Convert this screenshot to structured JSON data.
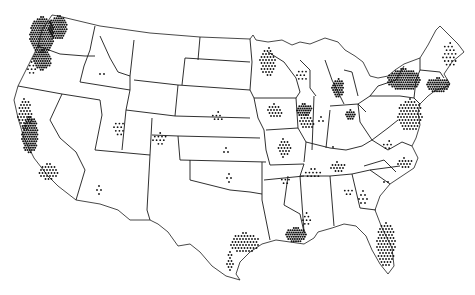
{
  "map": {
    "title": "",
    "region": "Contiguous United States",
    "style": "black-and-white dot distribution map",
    "colors": {
      "background": "#ffffff",
      "lines": "#1a1a1a",
      "dots": "#111111"
    },
    "clusters": [
      {
        "name": "Washington west",
        "cx": 42,
        "cy": 35,
        "rx": 12,
        "ry": 18,
        "density": "heavy"
      },
      {
        "name": "Washington Puget",
        "cx": 58,
        "cy": 28,
        "rx": 9,
        "ry": 12,
        "density": "heavy"
      },
      {
        "name": "Oregon Willamette",
        "cx": 42,
        "cy": 60,
        "rx": 9,
        "ry": 10,
        "density": "heavy"
      },
      {
        "name": "Oregon coast",
        "cx": 32,
        "cy": 68,
        "rx": 4,
        "ry": 6,
        "density": "light"
      },
      {
        "name": "California coast north",
        "cx": 25,
        "cy": 115,
        "rx": 7,
        "ry": 16,
        "density": "medium"
      },
      {
        "name": "California central",
        "cx": 30,
        "cy": 135,
        "rx": 8,
        "ry": 18,
        "density": "heavy"
      },
      {
        "name": "California south",
        "cx": 48,
        "cy": 172,
        "rx": 10,
        "ry": 8,
        "density": "medium"
      },
      {
        "name": "Montana",
        "cx": 125,
        "cy": 52,
        "rx": 3,
        "ry": 1,
        "density": "sparse"
      },
      {
        "name": "Idaho",
        "cx": 101,
        "cy": 74,
        "rx": 3,
        "ry": 4,
        "density": "sparse"
      },
      {
        "name": "Wyoming",
        "cx": 150,
        "cy": 93,
        "rx": 1,
        "ry": 1,
        "density": "sparse"
      },
      {
        "name": "Utah",
        "cx": 119,
        "cy": 128,
        "rx": 5,
        "ry": 8,
        "density": "light"
      },
      {
        "name": "Colorado",
        "cx": 160,
        "cy": 139,
        "rx": 7,
        "ry": 6,
        "density": "light"
      },
      {
        "name": "Arizona",
        "cx": 99,
        "cy": 190,
        "rx": 4,
        "ry": 4,
        "density": "sparse"
      },
      {
        "name": "New Mexico",
        "cx": 156,
        "cy": 178,
        "rx": 1,
        "ry": 1,
        "density": "sparse"
      },
      {
        "name": "North Dakota",
        "cx": 224,
        "cy": 61,
        "rx": 1,
        "ry": 1,
        "density": "sparse"
      },
      {
        "name": "South Dakota",
        "cx": 219,
        "cy": 89,
        "rx": 3,
        "ry": 1,
        "density": "sparse"
      },
      {
        "name": "Nebraska",
        "cx": 217,
        "cy": 117,
        "rx": 6,
        "ry": 5,
        "density": "light"
      },
      {
        "name": "Kansas",
        "cx": 227,
        "cy": 151,
        "rx": 5,
        "ry": 3,
        "density": "sparse"
      },
      {
        "name": "Oklahoma",
        "cx": 229,
        "cy": 178,
        "rx": 4,
        "ry": 4,
        "density": "sparse"
      },
      {
        "name": "Minnesota east",
        "cx": 268,
        "cy": 62,
        "rx": 8,
        "ry": 14,
        "density": "medium"
      },
      {
        "name": "Wisconsin",
        "cx": 302,
        "cy": 75,
        "rx": 5,
        "ry": 7,
        "density": "light"
      },
      {
        "name": "Iowa",
        "cx": 275,
        "cy": 111,
        "rx": 7,
        "ry": 7,
        "density": "medium"
      },
      {
        "name": "Chicago",
        "cx": 304,
        "cy": 110,
        "rx": 8,
        "ry": 6,
        "density": "heavy"
      },
      {
        "name": "Illinois",
        "cx": 307,
        "cy": 122,
        "rx": 7,
        "ry": 7,
        "density": "medium"
      },
      {
        "name": "Missouri",
        "cx": 284,
        "cy": 148,
        "rx": 7,
        "ry": 9,
        "density": "medium"
      },
      {
        "name": "Michigan",
        "cx": 338,
        "cy": 88,
        "rx": 6,
        "ry": 9,
        "density": "heavy"
      },
      {
        "name": "Indiana",
        "cx": 321,
        "cy": 120,
        "rx": 4,
        "ry": 3,
        "density": "sparse"
      },
      {
        "name": "Ohio",
        "cx": 351,
        "cy": 115,
        "rx": 5,
        "ry": 5,
        "density": "heavy"
      },
      {
        "name": "Kentucky",
        "cx": 333,
        "cy": 149,
        "rx": 4,
        "ry": 2,
        "density": "sparse"
      },
      {
        "name": "Tennessee",
        "cx": 313,
        "cy": 173,
        "rx": 9,
        "ry": 4,
        "density": "light"
      },
      {
        "name": "Tennessee east",
        "cx": 338,
        "cy": 167,
        "rx": 7,
        "ry": 5,
        "density": "medium"
      },
      {
        "name": "Arkansas",
        "cx": 285,
        "cy": 181,
        "rx": 5,
        "ry": 5,
        "density": "light"
      },
      {
        "name": "Mississippi Gulf",
        "cx": 307,
        "cy": 219,
        "rx": 4,
        "ry": 6,
        "density": "light"
      },
      {
        "name": "Louisiana",
        "cx": 296,
        "cy": 235,
        "rx": 11,
        "ry": 7,
        "density": "heavy"
      },
      {
        "name": "Texas Gulf",
        "cx": 245,
        "cy": 243,
        "rx": 14,
        "ry": 10,
        "density": "medium"
      },
      {
        "name": "Texas south coast",
        "cx": 230,
        "cy": 262,
        "rx": 3,
        "ry": 10,
        "density": "medium"
      },
      {
        "name": "Georgia",
        "cx": 348,
        "cy": 192,
        "rx": 5,
        "ry": 5,
        "density": "light"
      },
      {
        "name": "Georgia diagonal",
        "cx": 363,
        "cy": 198,
        "rx": 4,
        "ry": 7,
        "density": "sparse"
      },
      {
        "name": "South Carolina",
        "cx": 385,
        "cy": 182,
        "rx": 3,
        "ry": 4,
        "density": "sparse"
      },
      {
        "name": "North Carolina",
        "cx": 405,
        "cy": 163,
        "rx": 7,
        "ry": 5,
        "density": "medium"
      },
      {
        "name": "Florida",
        "cx": 386,
        "cy": 245,
        "rx": 9,
        "ry": 22,
        "density": "medium"
      },
      {
        "name": "New York",
        "cx": 404,
        "cy": 80,
        "rx": 16,
        "ry": 11,
        "density": "heavy"
      },
      {
        "name": "New England south",
        "cx": 438,
        "cy": 85,
        "rx": 12,
        "ry": 7,
        "density": "heavy"
      },
      {
        "name": "Maine",
        "cx": 450,
        "cy": 55,
        "rx": 7,
        "ry": 12,
        "density": "light"
      },
      {
        "name": "Vermont",
        "cx": 419,
        "cy": 67,
        "rx": 1,
        "ry": 3,
        "density": "sparse"
      },
      {
        "name": "Pennsylvania/NJ/MD",
        "cx": 410,
        "cy": 115,
        "rx": 12,
        "ry": 16,
        "density": "medium"
      },
      {
        "name": "West Virginia",
        "cx": 370,
        "cy": 137,
        "rx": 1,
        "ry": 1,
        "density": "sparse"
      },
      {
        "name": "Virginia",
        "cx": 388,
        "cy": 145,
        "rx": 6,
        "ry": 4,
        "density": "light"
      }
    ]
  }
}
